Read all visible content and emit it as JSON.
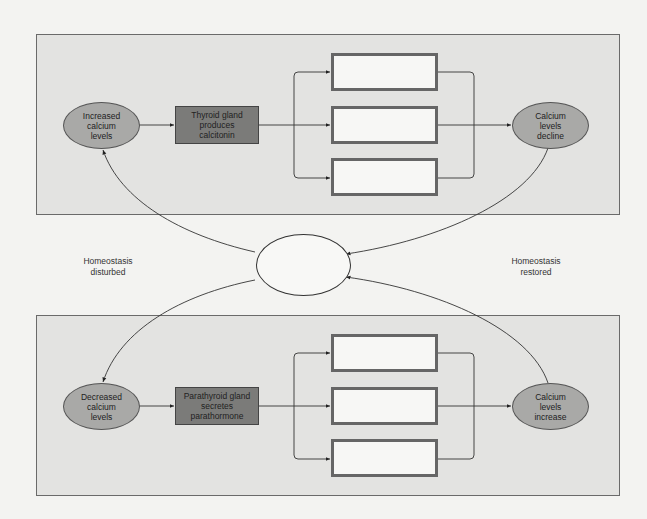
{
  "diagram": {
    "top_panel": {
      "stimulus": "Increased\ncalcium\nlevels",
      "gland": "Thyroid gland\nproduces\ncalcitonin",
      "effect_boxes": [
        "",
        "",
        ""
      ],
      "result": "Calcium\nlevels\ndecline"
    },
    "bottom_panel": {
      "stimulus": "Decreased\ncalcium\nlevels",
      "gland": "Parathyroid gland\nsecretes\nparathormone",
      "effect_boxes": [
        "",
        "",
        ""
      ],
      "result": "Calcium\nlevels\nincrease"
    },
    "center": {
      "label": ""
    },
    "side_labels": {
      "left": "Homeostasis\ndisturbed",
      "right": "Homeostasis\nrestored"
    },
    "colors": {
      "panel_bg": "#e3e3e1",
      "oval_fill": "#a9a9a7",
      "gland_fill": "#7b7b79",
      "blank_box_border": "#666666",
      "page_bg": "#f3f3f1"
    }
  }
}
